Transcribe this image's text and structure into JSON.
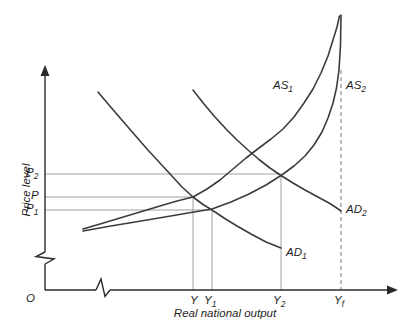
{
  "figure": {
    "background": "#ffffff",
    "axis_color": "#2a2a2a",
    "curve_color": "#3c3c3c",
    "guide_color": "#a0a0a0",
    "dashed_color": "#8f8f8f",
    "text_color": "#1e1e1e"
  },
  "chart_data": {
    "type": "line",
    "title": "",
    "xlabel": "Real national output",
    "ylabel": "Price level",
    "origin_label": "O",
    "x_tick_labels": [
      "Y",
      "Y1",
      "Y2",
      "Yf"
    ],
    "y_tick_labels": [
      "P2",
      "P",
      "P1"
    ],
    "axes_note": "qualitative diagram, symbolic ticks only, axis break symbols on both axes",
    "coords": "screen-px (411x335, y down)",
    "series": [
      {
        "id": "as1",
        "name": "AS1",
        "label": {
          "base": "AS",
          "sub": "1"
        },
        "kind": "aggregate-supply",
        "points": [
          [
            83,
            229
          ],
          [
            100,
            224
          ],
          [
            120,
            218
          ],
          [
            140,
            212
          ],
          [
            160,
            206
          ],
          [
            177,
            201
          ],
          [
            193,
            197
          ],
          [
            207,
            189
          ],
          [
            220,
            180
          ],
          [
            233,
            169
          ],
          [
            246,
            158
          ],
          [
            259,
            148
          ],
          [
            271,
            139
          ],
          [
            283,
            129
          ],
          [
            294,
            117
          ],
          [
            304,
            103
          ],
          [
            313,
            89
          ],
          [
            321,
            73
          ],
          [
            328,
            56
          ],
          [
            333,
            40
          ],
          [
            337,
            27
          ],
          [
            339.5,
            16
          ]
        ]
      },
      {
        "id": "as2",
        "name": "AS2",
        "label": {
          "base": "AS",
          "sub": "2"
        },
        "kind": "aggregate-supply",
        "points": [
          [
            83,
            231
          ],
          [
            108,
            226.5
          ],
          [
            135,
            222
          ],
          [
            162,
            217.5
          ],
          [
            188,
            213
          ],
          [
            212,
            209
          ],
          [
            231,
            202
          ],
          [
            249,
            194
          ],
          [
            266,
            185
          ],
          [
            281,
            175.5
          ],
          [
            294,
            166
          ],
          [
            305,
            156
          ],
          [
            314,
            145
          ],
          [
            322,
            132
          ],
          [
            328,
            118
          ],
          [
            333,
            103
          ],
          [
            336.5,
            88
          ],
          [
            339,
            70
          ],
          [
            340.5,
            45
          ],
          [
            341,
            15
          ]
        ]
      },
      {
        "id": "ad1",
        "name": "AD1",
        "label": {
          "base": "AD",
          "sub": "1"
        },
        "kind": "aggregate-demand",
        "points": [
          [
            98,
            92
          ],
          [
            109,
            105
          ],
          [
            121,
            119
          ],
          [
            134,
            134
          ],
          [
            147,
            149
          ],
          [
            159,
            162
          ],
          [
            171,
            175
          ],
          [
            182,
            187
          ],
          [
            193,
            197
          ],
          [
            203,
            204.5
          ],
          [
            212,
            210
          ],
          [
            224,
            218
          ],
          [
            237,
            226
          ],
          [
            251,
            234
          ],
          [
            266,
            242
          ],
          [
            281,
            248
          ]
        ]
      },
      {
        "id": "ad2",
        "name": "AD2",
        "label": {
          "base": "AD",
          "sub": "2"
        },
        "kind": "aggregate-demand",
        "points": [
          [
            193,
            90
          ],
          [
            204,
            104
          ],
          [
            215,
            117
          ],
          [
            226,
            129
          ],
          [
            237,
            140
          ],
          [
            248,
            150
          ],
          [
            259,
            159.5
          ],
          [
            270,
            168
          ],
          [
            281,
            175.5
          ],
          [
            293,
            183
          ],
          [
            305,
            190
          ],
          [
            317,
            196.5
          ],
          [
            329,
            203
          ],
          [
            336,
            207.5
          ],
          [
            341,
            211
          ]
        ]
      }
    ],
    "price_lines": [
      {
        "id": "p2",
        "label": {
          "base": "P",
          "sub": "2"
        },
        "y": 174,
        "x_end": 281
      },
      {
        "id": "p",
        "label": {
          "base": "P",
          "sub": ""
        },
        "y": 197,
        "x_end": 193
      },
      {
        "id": "p1",
        "label": {
          "base": "P",
          "sub": "1"
        },
        "y": 210,
        "x_end": 212
      }
    ],
    "output_lines": [
      {
        "id": "y",
        "label": {
          "base": "Y",
          "sub": ""
        },
        "x": 193,
        "y_top": 197,
        "style": "solid"
      },
      {
        "id": "y1",
        "label": {
          "base": "Y",
          "sub": "1"
        },
        "x": 212,
        "y_top": 210,
        "style": "solid"
      },
      {
        "id": "y2",
        "label": {
          "base": "Y",
          "sub": "2"
        },
        "x": 281,
        "y_top": 174,
        "style": "solid"
      },
      {
        "id": "yf",
        "label": {
          "base": "Y",
          "sub": "f"
        },
        "x": 341,
        "y_top": 70,
        "style": "dashed"
      }
    ],
    "equilibrium_points": [
      {
        "at": [
          "AD1",
          "AS1"
        ],
        "price": "P",
        "output": "Y"
      },
      {
        "at": [
          "AD1",
          "AS2"
        ],
        "price": "P1",
        "output": "Y1"
      },
      {
        "at": [
          "AD2",
          "AS2"
        ],
        "price": "P2",
        "output": "Y2"
      }
    ]
  }
}
